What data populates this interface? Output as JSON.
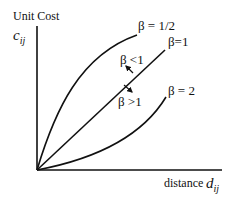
{
  "diagram": {
    "type": "cost-distance curves",
    "y_axis": {
      "label": "Unit Cost",
      "symbol": "c",
      "subscript": "ij"
    },
    "x_axis": {
      "label": "distance",
      "symbol": "d",
      "subscript": "ij"
    },
    "curves": [
      {
        "id": "beta-half",
        "label": "β = 1/2",
        "shape": "concave"
      },
      {
        "id": "beta-one",
        "label": "β=1",
        "shape": "linear"
      },
      {
        "id": "beta-two",
        "label": "β = 2",
        "shape": "convex"
      }
    ],
    "annotations": [
      {
        "id": "beta-lt-1",
        "label": "β <1",
        "arrow": "up-left"
      },
      {
        "id": "beta-gt-1",
        "label": "β >1",
        "arrow": "down-right"
      }
    ],
    "colors": {
      "line": "#111111",
      "background": "#ffffff"
    }
  }
}
